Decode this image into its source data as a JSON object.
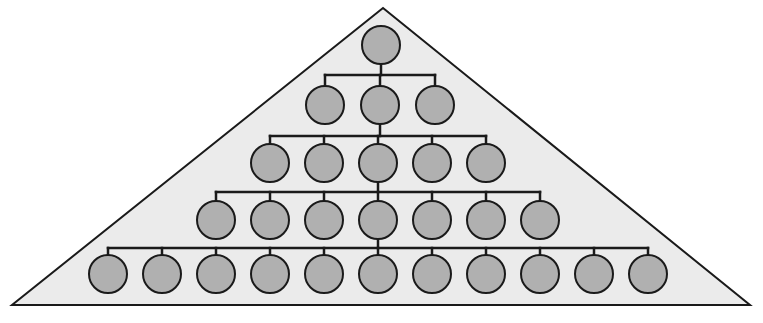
{
  "canvas": {
    "width": 763,
    "height": 323,
    "background_color": "#ffffff"
  },
  "diagram": {
    "type": "tree-in-triangle",
    "shape": {
      "name": "triangle-background",
      "apex": {
        "x": 383,
        "y": 8
      },
      "bottom_left": {
        "x": 12,
        "y": 305
      },
      "bottom_right": {
        "x": 750,
        "y": 305
      },
      "fill_color": "#ebebeb",
      "stroke_color": "#1a1a1a",
      "stroke_width": 2
    },
    "node_style": {
      "fill_color": "#b0b0b0",
      "stroke_color": "#1a1a1a",
      "stroke_width": 2,
      "radius_x": 19,
      "radius_y": 19
    },
    "connector_style": {
      "stroke_color": "#1a1a1a",
      "stroke_width": 2.5
    },
    "levels": [
      {
        "level": 1,
        "label": "root",
        "node_count": 1,
        "center_y": 45,
        "nodes": [
          {
            "id": "n1-1",
            "cx": 381,
            "cy": 45
          }
        ]
      },
      {
        "level": 2,
        "label": "second-level",
        "node_count": 3,
        "center_y": 105,
        "bar_y": 75,
        "bar_x1": 325,
        "bar_x2": 435,
        "nodes": [
          {
            "id": "n2-1",
            "cx": 325,
            "cy": 105
          },
          {
            "id": "n2-2",
            "cx": 380,
            "cy": 105
          },
          {
            "id": "n2-3",
            "cx": 435,
            "cy": 105
          }
        ]
      },
      {
        "level": 3,
        "label": "third-level",
        "node_count": 5,
        "center_y": 163,
        "bar_y": 136,
        "bar_x1": 270,
        "bar_x2": 486,
        "nodes": [
          {
            "id": "n3-1",
            "cx": 270,
            "cy": 163
          },
          {
            "id": "n3-2",
            "cx": 324,
            "cy": 163
          },
          {
            "id": "n3-3",
            "cx": 378,
            "cy": 163
          },
          {
            "id": "n3-4",
            "cx": 432,
            "cy": 163
          },
          {
            "id": "n3-5",
            "cx": 486,
            "cy": 163
          }
        ]
      },
      {
        "level": 4,
        "label": "fourth-level",
        "node_count": 7,
        "center_y": 220,
        "bar_y": 192,
        "bar_x1": 216,
        "bar_x2": 540,
        "nodes": [
          {
            "id": "n4-1",
            "cx": 216,
            "cy": 220
          },
          {
            "id": "n4-2",
            "cx": 270,
            "cy": 220
          },
          {
            "id": "n4-3",
            "cx": 324,
            "cy": 220
          },
          {
            "id": "n4-4",
            "cx": 378,
            "cy": 220
          },
          {
            "id": "n4-5",
            "cx": 432,
            "cy": 220
          },
          {
            "id": "n4-6",
            "cx": 486,
            "cy": 220
          },
          {
            "id": "n4-7",
            "cx": 540,
            "cy": 220
          }
        ]
      },
      {
        "level": 5,
        "label": "fifth-level",
        "node_count": 11,
        "center_y": 274,
        "bar_y": 248,
        "bar_x1": 108,
        "bar_x2": 648,
        "nodes": [
          {
            "id": "n5-1",
            "cx": 108,
            "cy": 274
          },
          {
            "id": "n5-2",
            "cx": 162,
            "cy": 274
          },
          {
            "id": "n5-3",
            "cx": 216,
            "cy": 274
          },
          {
            "id": "n5-4",
            "cx": 270,
            "cy": 274
          },
          {
            "id": "n5-5",
            "cx": 324,
            "cy": 274
          },
          {
            "id": "n5-6",
            "cx": 378,
            "cy": 274
          },
          {
            "id": "n5-7",
            "cx": 432,
            "cy": 274
          },
          {
            "id": "n5-8",
            "cx": 486,
            "cy": 274
          },
          {
            "id": "n5-9",
            "cx": 540,
            "cy": 274
          },
          {
            "id": "n5-10",
            "cx": 594,
            "cy": 274
          },
          {
            "id": "n5-11",
            "cx": 648,
            "cy": 274
          }
        ]
      }
    ]
  }
}
